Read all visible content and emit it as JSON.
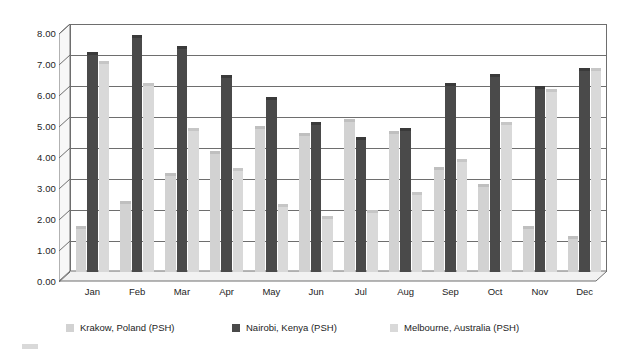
{
  "chart_data": {
    "type": "bar",
    "title": "",
    "subtitle": "",
    "xlabel": "",
    "ylabel": "",
    "ylim": [
      0,
      8
    ],
    "ytick_step": 1,
    "ytick_labels": [
      "0.00",
      "1.00",
      "2.00",
      "3.00",
      "4.00",
      "5.00",
      "6.00",
      "7.00",
      "8.00"
    ],
    "grid": true,
    "legend_position": "bottom",
    "style": "3d-clustered-column",
    "categories": [
      "Jan",
      "Feb",
      "Mar",
      "Apr",
      "May",
      "Jun",
      "Jul",
      "Aug",
      "Sep",
      "Oct",
      "Nov",
      "Dec"
    ],
    "series": [
      {
        "name": "Krakow, Poland (PSH)",
        "color": "#d2d2d2",
        "top_color": "#bfbfbf",
        "values": [
          1.4,
          2.2,
          3.1,
          3.8,
          4.6,
          4.4,
          4.85,
          4.45,
          3.3,
          2.75,
          1.4,
          1.05
        ]
      },
      {
        "name": "Nairobi, Kenya (PSH)",
        "color": "#4a4a4a",
        "top_color": "#3a3a3a",
        "values": [
          7.0,
          7.55,
          7.2,
          6.25,
          5.55,
          4.75,
          4.25,
          4.55,
          6.0,
          6.3,
          5.9,
          6.5
        ]
      },
      {
        "name": "Melbourne, Australia (PSH)",
        "color": "#d9d9d9",
        "top_color": "#c6c6c6",
        "values": [
          6.7,
          6.0,
          4.55,
          3.25,
          2.1,
          1.7,
          1.9,
          2.5,
          3.55,
          4.75,
          5.8,
          6.5
        ]
      }
    ]
  },
  "axis": {
    "y_labels": [
      "8.00",
      "7.00",
      "6.00",
      "5.00",
      "4.00",
      "3.00",
      "2.00",
      "1.00",
      "0.00"
    ],
    "x_labels": [
      "Jan",
      "Feb",
      "Mar",
      "Apr",
      "May",
      "Jun",
      "Jul",
      "Aug",
      "Sep",
      "Oct",
      "Nov",
      "Dec"
    ]
  },
  "legend": {
    "items": [
      {
        "label": "Krakow, Poland (PSH)",
        "color": "#d2d2d2"
      },
      {
        "label": "Nairobi, Kenya (PSH)",
        "color": "#4a4a4a"
      },
      {
        "label": "Melbourne, Australia (PSH)",
        "color": "#d9d9d9"
      }
    ]
  },
  "colors": {
    "axis_line": "#6e6e6e",
    "grid_line": "#6e6e6e",
    "depth_face": "#f2f2f2",
    "text": "#242424",
    "background": "#ffffff"
  }
}
